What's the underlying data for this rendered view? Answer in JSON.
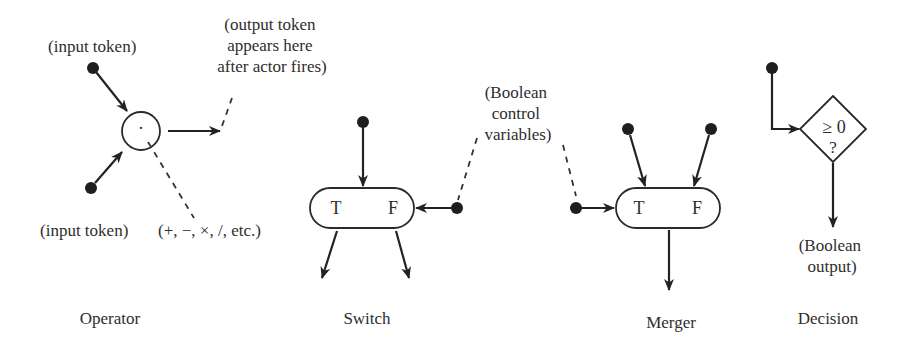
{
  "diagram": {
    "colors": {
      "ink": "#222222",
      "text": "#2e2e2e",
      "background": "#ffffff"
    },
    "operator": {
      "caption": "Operator",
      "input_label_top": "(input token)",
      "input_label_bottom": "(input token)",
      "op_symbols": "(+, −, ×, /, etc.)",
      "symbol": "·",
      "output_note": [
        "(output token",
        "appears here",
        "after actor fires)"
      ]
    },
    "switch": {
      "caption": "Switch",
      "true_label": "T",
      "false_label": "F"
    },
    "control": {
      "note": [
        "(Boolean",
        "control",
        "variables)"
      ]
    },
    "merger": {
      "caption": "Merger",
      "true_label": "T",
      "false_label": "F"
    },
    "decision": {
      "caption": "Decision",
      "condition": "≥ 0",
      "question": "?",
      "output_note": [
        "(Boolean",
        "output)"
      ]
    }
  }
}
